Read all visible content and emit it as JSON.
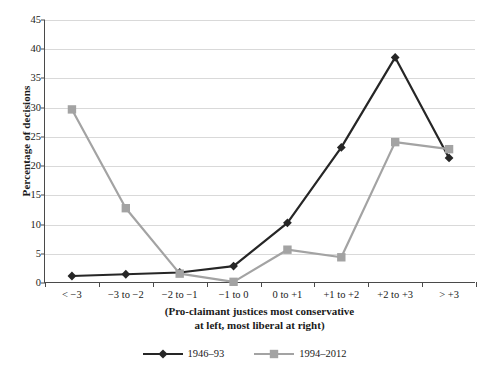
{
  "chart_data": {
    "type": "line",
    "title": "",
    "xlabel": "(Pro-claimant justices most conservative at left, most liberal at right)",
    "ylabel": "Percentage of decisions",
    "categories": [
      "< −3",
      "−3 to −2",
      "−2 to −1",
      "−1 to 0",
      "0 to +1",
      "+1 to +2",
      "+2 to +3",
      "> +3"
    ],
    "series": [
      {
        "name": "1946–93",
        "values": [
          1.2,
          1.5,
          1.8,
          2.9,
          10.3,
          23.2,
          38.6,
          21.4
        ],
        "color": "#262626",
        "marker": "diamond"
      },
      {
        "name": "1994–2012",
        "values": [
          29.7,
          12.8,
          1.6,
          0.2,
          5.7,
          4.4,
          24.1,
          22.9
        ],
        "color": "#a3a3a3",
        "marker": "square"
      }
    ],
    "ylim": [
      0,
      45
    ],
    "ytick_step": 5,
    "yticks": [
      "0",
      "5",
      "10",
      "15",
      "20",
      "25",
      "30",
      "35",
      "40",
      "45"
    ],
    "grid": true,
    "legend_position": "bottom"
  },
  "axis": {
    "y_title": "Percentage of decisions",
    "x_caption_line1": "(Pro-claimant justices most conservative",
    "x_caption_line2": "at left, most liberal at right)"
  },
  "legend": {
    "items": [
      {
        "label": "1946–93",
        "color": "#262626",
        "marker": "diamond"
      },
      {
        "label": "1994–2012",
        "color": "#a3a3a3",
        "marker": "square"
      }
    ]
  }
}
